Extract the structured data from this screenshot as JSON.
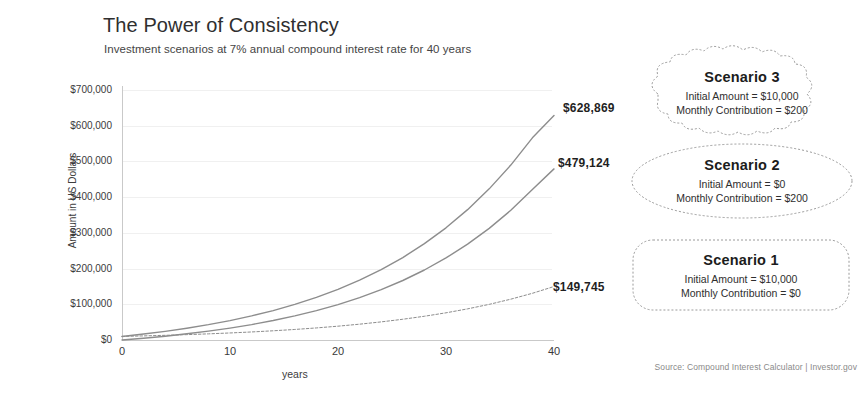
{
  "header": {
    "title": "The Power of Consistency",
    "subtitle": "Investment scenarios at 7% annual compound interest rate for 40 years"
  },
  "source": "Source: Compound Interest Calculator | Investor.gov",
  "callouts": [
    {
      "shape": "cloud",
      "title": "Scenario 3",
      "initial_label": "Initial Amount = $10,000",
      "monthly_label": "Monthly Contribution = $200"
    },
    {
      "shape": "ellipse",
      "title": "Scenario 2",
      "initial_label": "Initial Amount = $0",
      "monthly_label": "Monthly Contribution = $200"
    },
    {
      "shape": "rounded-rect",
      "title": "Scenario 1",
      "initial_label": "Initial Amount = $10,000",
      "monthly_label": "Monthly Contribution = $0"
    }
  ],
  "endpoint_labels": {
    "scenario3": "$628,869",
    "scenario2": "$479,124",
    "scenario1": "$149,745"
  },
  "colors": {
    "line": "#8d8d8d",
    "grid": "#f0f0f0",
    "axis": "#c9c9c9",
    "text": "#3a3a3a"
  },
  "chart_data": {
    "type": "line",
    "title": "The Power of Consistency",
    "subtitle": "Investment scenarios at 7% annual compound interest rate for 40 years",
    "xlabel": "years",
    "ylabel": "Amount in US Dollars",
    "xlim": [
      0,
      40
    ],
    "ylim": [
      0,
      700000
    ],
    "xticks": [
      0,
      10,
      20,
      30,
      40
    ],
    "xtick_labels": [
      "0",
      "10",
      "20",
      "30",
      "40"
    ],
    "yticks": [
      0,
      100000,
      200000,
      300000,
      400000,
      500000,
      600000,
      700000
    ],
    "ytick_labels": [
      "$0",
      "$100,000",
      "$200,000",
      "$300,000",
      "$400,000",
      "$500,000",
      "$600,000",
      "$700,000"
    ],
    "grid": true,
    "legend": "none",
    "annual_rate_pct": 7,
    "x": [
      0,
      2,
      4,
      6,
      8,
      10,
      12,
      14,
      16,
      18,
      20,
      22,
      24,
      26,
      28,
      30,
      32,
      34,
      36,
      38,
      40
    ],
    "series": [
      {
        "name": "Scenario 3",
        "initial_amount": 10000,
        "monthly_contribution": 200,
        "final_value": 628869,
        "end_label": "$628,869",
        "values": [
          10000,
          16600,
          24200,
          32900,
          42900,
          54300,
          67400,
          82400,
          99600,
          119200,
          141700,
          167500,
          197000,
          230900,
          269700,
          314100,
          365000,
          423200,
          489800,
          566000,
          628869
        ]
      },
      {
        "name": "Scenario 2",
        "initial_amount": 0,
        "monthly_contribution": 200,
        "final_value": 479124,
        "end_label": "$479,124",
        "values": [
          0,
          5000,
          10700,
          17300,
          24800,
          33400,
          43200,
          54500,
          67400,
          82200,
          99200,
          118700,
          141000,
          166600,
          196000,
          229700,
          268300,
          312500,
          363100,
          421100,
          479124
        ]
      },
      {
        "name": "Scenario 1",
        "initial_amount": 10000,
        "monthly_contribution": 0,
        "final_value": 149745,
        "end_label": "$149,745",
        "values": [
          10000,
          11500,
          13100,
          15000,
          17200,
          19700,
          22500,
          25800,
          29500,
          33800,
          38700,
          44300,
          50700,
          58100,
          66500,
          76100,
          87200,
          99800,
          114300,
          130800,
          149745
        ]
      }
    ]
  }
}
